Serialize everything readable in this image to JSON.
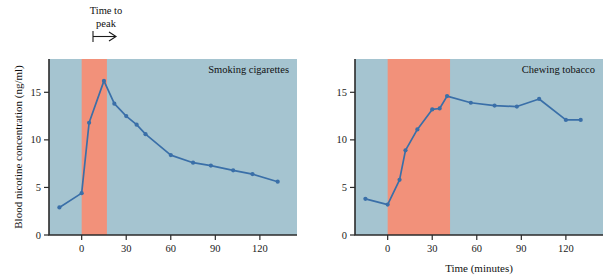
{
  "figure": {
    "axis_titles": {
      "y": "Blood nicotine concentration (ng/ml)",
      "x": "Time (minutes)"
    },
    "annotation": {
      "line1": "Time to",
      "line2": "peak",
      "arrow_icon": "right-arrow-icon"
    },
    "colors": {
      "plot_background": "#a5c4d0",
      "peak_band": "#f2917a",
      "series": "#3a6fa8",
      "axis": "#2b2b2b"
    }
  },
  "chart_data": [
    {
      "type": "line",
      "title": "Smoking cigarettes",
      "xlabel": "Time (minutes)",
      "ylabel": "Blood nicotine concentration (ng/ml)",
      "xlim": [
        -22,
        145
      ],
      "ylim": [
        0,
        18.5
      ],
      "xticks": [
        0,
        30,
        60,
        90,
        120
      ],
      "yticks": [
        0,
        5,
        10,
        15
      ],
      "grid": false,
      "legend": "none",
      "shaded_band": {
        "label": "Time to peak",
        "x_start": 0,
        "x_end": 17
      },
      "x": [
        -15,
        0,
        5,
        15,
        22,
        30,
        37,
        43,
        60,
        75,
        87,
        102,
        115,
        132
      ],
      "y": [
        2.9,
        4.4,
        11.8,
        16.2,
        13.8,
        12.5,
        11.6,
        10.6,
        8.4,
        7.6,
        7.3,
        6.8,
        6.4,
        5.6
      ]
    },
    {
      "type": "line",
      "title": "Chewing tobacco",
      "xlabel": "Time (minutes)",
      "ylabel": "Blood nicotine concentration (ng/ml)",
      "xlim": [
        -22,
        145
      ],
      "ylim": [
        0,
        18.5
      ],
      "xticks": [
        0,
        30,
        60,
        90,
        120
      ],
      "yticks": [
        0,
        5,
        10,
        15
      ],
      "grid": false,
      "legend": "none",
      "shaded_band": {
        "label": "Time to peak",
        "x_start": 0,
        "x_end": 42
      },
      "x": [
        -15,
        0,
        8,
        12,
        20,
        30,
        35,
        40,
        56,
        72,
        87,
        102,
        120,
        130
      ],
      "y": [
        3.8,
        3.2,
        5.8,
        8.9,
        11.1,
        13.2,
        13.3,
        14.6,
        13.9,
        13.6,
        13.5,
        14.3,
        12.1,
        12.1
      ]
    }
  ]
}
